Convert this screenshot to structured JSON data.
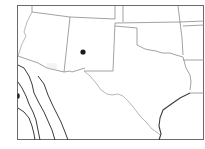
{
  "map": {
    "type": "outline-map",
    "region": "Southwestern United States",
    "visible_states": [
      "Arizona",
      "New Mexico",
      "Texas",
      "Oklahoma",
      "Colorado",
      "Utah",
      "Kansas"
    ],
    "labels": [],
    "markers": [
      {
        "id": "marker-1",
        "shape": "filled-circle",
        "color": "#1a1a1a",
        "location": "central New Mexico"
      }
    ],
    "colors": {
      "background": "#ffffff",
      "frame": "#6a6a6a",
      "state_border": "#8a8a8a",
      "coastline": "#3e3e3e",
      "marker": "#1a1a1a"
    }
  }
}
